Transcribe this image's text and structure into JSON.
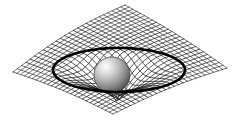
{
  "figure": {
    "alt_description": "A rectangular grid sheet warped downward into a funnel with a shaded sphere resting at the bottom, encircled by a thick black ellipse",
    "canvas": {
      "width": 239,
      "height": 123,
      "background": "#ffffff"
    }
  },
  "elements": {
    "grid_label": "spacetime-grid-sheet",
    "ring_label": "event-horizon-ring",
    "sphere_label": "massive-body-sphere",
    "well_label": "gravity-well-funnel"
  },
  "colors": {
    "background": "#ffffff",
    "grid_stroke": "#1c1c1c",
    "ring_stroke": "#000000",
    "sphere_highlight": "#f2f2f2",
    "sphere_mid": "#9d9d9d",
    "sphere_shadow": "#4a4a4a",
    "sphere_rim": "#2f2f2f"
  },
  "geometry": {
    "sheet_corners": {
      "left": [
        13,
        72
      ],
      "top": [
        125,
        5
      ],
      "right": [
        227,
        68
      ],
      "bottom": [
        113,
        114
      ]
    },
    "grid_divisions_u": 26,
    "grid_divisions_v": 26,
    "well_center": [
      117,
      72
    ],
    "well_radius_x": 60,
    "well_radius_y": 20,
    "well_depth": 30,
    "ring": {
      "cx": 119,
      "cy": 70,
      "rx": 66,
      "ry": 22,
      "stroke_width": 2.6
    },
    "sphere": {
      "cx": 112,
      "cy": 75,
      "r": 18
    }
  },
  "chart_data": {
    "type": "scatter",
    "xlabel": "",
    "ylabel": "",
    "annotations": [
      "warped grid sheet",
      "event horizon ellipse",
      "central massive sphere"
    ]
  }
}
